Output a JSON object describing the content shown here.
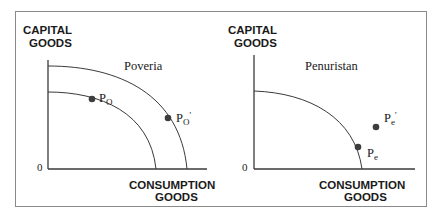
{
  "panels": [
    {
      "name": "Poveria",
      "y_axis_label": [
        "CAPITAL",
        "GOODS"
      ],
      "x_axis_label": [
        "CONSUMPTION",
        "GOODS"
      ],
      "origin_label": "0",
      "curves": [
        "inner-ppf",
        "outer-ppf"
      ],
      "points": [
        {
          "label": "P",
          "sub": "O",
          "prime": "",
          "on": "inner-ppf"
        },
        {
          "label": "P",
          "sub": "O",
          "prime": "'",
          "on": "outer-ppf"
        }
      ]
    },
    {
      "name": "Penuristan",
      "y_axis_label": [
        "CAPITAL",
        "GOODS"
      ],
      "x_axis_label": [
        "CONSUMPTION",
        "GOODS"
      ],
      "origin_label": "0",
      "curves": [
        "ppf"
      ],
      "points": [
        {
          "label": "P",
          "sub": "e",
          "prime": "",
          "on": "ppf"
        },
        {
          "label": "P",
          "sub": "e",
          "prime": "'",
          "on": "outside-ppf"
        }
      ]
    }
  ],
  "colors": {
    "line": "#3a3a3a",
    "point": "#3d3d3d",
    "text": "#1a1a1a",
    "frame": "#8a8a8a"
  }
}
